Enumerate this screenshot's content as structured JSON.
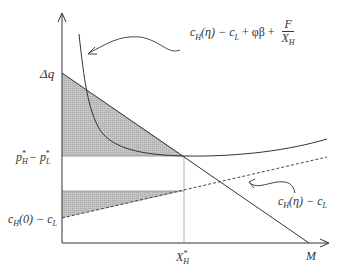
{
  "diagram": {
    "type": "economic-graph",
    "axes": {
      "x_label": "M",
      "y_label": "Δq"
    },
    "labels": {
      "delta_q": "Δq",
      "price_gap": {
        "p": "p",
        "sub_h": "H",
        "sup": "*",
        "minus": " − ",
        "sub_l": "L"
      },
      "cost_gap_zero": {
        "c": "c",
        "sub_h": "H",
        "arg": "(0) − c",
        "sub_l": "L"
      },
      "x_star": {
        "x": "X",
        "sub": "H",
        "sup": "*"
      },
      "m_label": "M",
      "upper_curve": {
        "c": "c",
        "sub_h": "H",
        "arg": "(η) − c",
        "sub_l": "L",
        "rest": " + φβ + ",
        "num": "F",
        "den_x": "X",
        "den_sub": "H"
      },
      "dashed_line": {
        "c": "c",
        "sub_h": "H",
        "arg": "(η) − c",
        "sub_l": "L"
      }
    },
    "colors": {
      "line": "#333333",
      "shade": "#bdbdbd",
      "guide": "#999999"
    }
  }
}
